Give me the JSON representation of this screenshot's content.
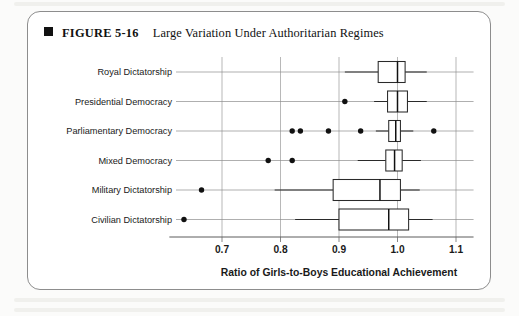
{
  "figure": {
    "bullet_icon": "filled-square-icon",
    "figure_number": "FIGURE 5-16",
    "title": "Large Variation Under Authoritarian Regimes"
  },
  "chart_data": {
    "type": "box",
    "title": "Large Variation Under Authoritarian Regimes",
    "xlabel": "Ratio of Girls-to-Boys Educational Achievement",
    "ylabel": "",
    "xlim": [
      0.61,
      1.13
    ],
    "xticks": [
      0.7,
      0.8,
      0.9,
      1.0,
      1.1
    ],
    "xtick_labels": [
      "0.7",
      "0.8",
      "0.9",
      "1.0",
      "1.1"
    ],
    "grid": true,
    "grid_axis": "x",
    "legend": "none",
    "orientation": "horizontal",
    "categories": [
      "Royal Dictatorship",
      "Presidential Democracy",
      "Parliamentary Democracy",
      "Mixed Democracy",
      "Military Dictatorship",
      "Civilian Dictatorship"
    ],
    "boxes": [
      {
        "category": "Royal Dictatorship",
        "whisker_low": 0.91,
        "q1": 0.967,
        "median": 1.0,
        "q3": 1.013,
        "whisker_high": 1.05,
        "outliers": []
      },
      {
        "category": "Presidential Democracy",
        "whisker_low": 0.96,
        "q1": 0.983,
        "median": 1.0,
        "q3": 1.017,
        "whisker_high": 1.05,
        "outliers": [
          0.91
        ]
      },
      {
        "category": "Parliamentary Democracy",
        "whisker_low": 0.963,
        "q1": 0.985,
        "median": 0.997,
        "q3": 1.005,
        "whisker_high": 1.027,
        "outliers": [
          0.82,
          0.834,
          0.882,
          0.937,
          1.062
        ]
      },
      {
        "category": "Mixed Democracy",
        "whisker_low": 0.932,
        "q1": 0.98,
        "median": 0.995,
        "q3": 1.008,
        "whisker_high": 1.04,
        "outliers": [
          0.779,
          0.82
        ]
      },
      {
        "category": "Military Dictatorship",
        "whisker_low": 0.79,
        "q1": 0.89,
        "median": 0.97,
        "q3": 1.005,
        "whisker_high": 1.038,
        "outliers": [
          0.665
        ]
      },
      {
        "category": "Civilian Dictatorship",
        "whisker_low": 0.825,
        "q1": 0.9,
        "median": 0.985,
        "q3": 1.019,
        "whisker_high": 1.06,
        "outliers": [
          0.635
        ]
      }
    ]
  }
}
